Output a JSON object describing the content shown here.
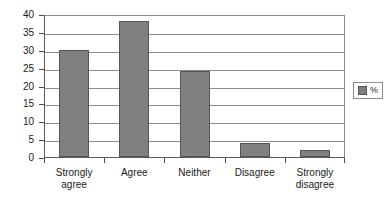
{
  "chart_data": {
    "type": "bar",
    "title": "",
    "subtitle": "",
    "xlabel": "",
    "ylabel": "",
    "categories": [
      "Strongly agree",
      "Agree",
      "Neither",
      "Disagree",
      "Strongly disagree"
    ],
    "category_labels_wrapped": [
      "Strongly\nagree",
      "Agree",
      "Neither",
      "Disagree",
      "Strongly\ndisagree"
    ],
    "values": [
      30,
      38,
      24,
      4,
      2
    ],
    "series": [
      {
        "name": "%",
        "values": [
          30,
          38,
          24,
          4,
          2
        ]
      }
    ],
    "ylim": [
      0,
      40
    ],
    "ytick_step": 5,
    "ytick_labels": [
      "0",
      "5",
      "10",
      "15",
      "20",
      "25",
      "30",
      "35",
      "40"
    ],
    "ytick_values": [
      0,
      5,
      10,
      15,
      20,
      25,
      30,
      35,
      40
    ],
    "grid": true,
    "grid_orientation": "horizontal",
    "legend": {
      "visible": true,
      "position": "right",
      "entries": [
        "%"
      ]
    },
    "colors": {
      "bar_fill": "#808080",
      "bar_border": "#555555",
      "gridline": "#8c8c8c",
      "axis": "#4a4a4a",
      "text": "#1a1a1a",
      "background": "#ffffff"
    }
  },
  "legend": {
    "series_label": "%"
  }
}
